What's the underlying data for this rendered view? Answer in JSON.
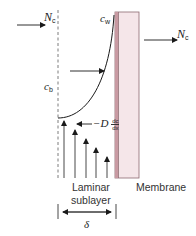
{
  "diagram": {
    "flux_in_label": {
      "symbol": "N",
      "subscript": "c"
    },
    "flux_out_label": {
      "symbol": "N",
      "subscript": "c"
    },
    "bulk_concentration_label": {
      "symbol": "c",
      "subscript": "b"
    },
    "wall_concentration_label": {
      "symbol": "c",
      "subscript": "w"
    },
    "back_diffusion_label": {
      "symbol": "D",
      "numerator": "dc",
      "denominator": "dx"
    },
    "laminar_label_line1": "Laminar",
    "laminar_label_line2": "sublayer",
    "membrane_label": "Membrane",
    "thickness_label": "δ",
    "colors": {
      "membrane_fill": "#f5e6e9",
      "membrane_edge": "#c89aa2",
      "membrane_border": "#8c6a70",
      "line": "#1a1a1a",
      "dashed": "#6e6e6e"
    }
  }
}
